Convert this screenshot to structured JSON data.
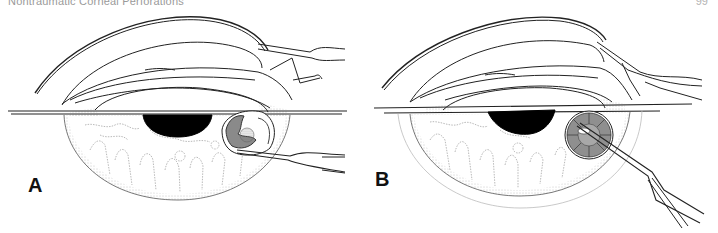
{
  "page": {
    "running_head": "Nontraumatic Corneal Perforations",
    "page_number": "99"
  },
  "figure": {
    "panels": [
      {
        "label": "A",
        "description": "Cross-section of eye with corneal perforation; instrument inserted into lesion at lower right of iris"
      },
      {
        "label": "B",
        "description": "Cross-section of eye with patch graft sutured over perforation; forceps instrument applied"
      }
    ],
    "colors": {
      "line": "#222222",
      "stipple": "#9a9a9a",
      "lesion_fill": "#8a8a8a",
      "pupil": "#000000",
      "background": "#ffffff"
    }
  }
}
